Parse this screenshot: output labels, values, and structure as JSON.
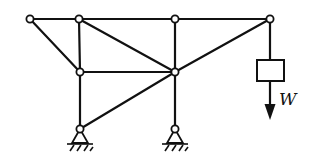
{
  "diagram": {
    "type": "truss-frame",
    "load_label": "W",
    "nodes": {
      "A": [
        30,
        19
      ],
      "B": [
        79,
        19
      ],
      "C": [
        175,
        19
      ],
      "D": [
        270,
        19
      ],
      "E": [
        80,
        72
      ],
      "F": [
        175,
        72
      ],
      "G": [
        80,
        129
      ],
      "H": [
        175,
        129
      ]
    },
    "members": [
      [
        "A",
        "B"
      ],
      [
        "B",
        "C"
      ],
      [
        "C",
        "D"
      ],
      [
        "A",
        "E"
      ],
      [
        "B",
        "E"
      ],
      [
        "B",
        "F"
      ],
      [
        "E",
        "F"
      ],
      [
        "D",
        "F"
      ],
      [
        "E",
        "G"
      ],
      [
        "G",
        "F"
      ],
      [
        "C",
        "F"
      ],
      [
        "F",
        "H"
      ]
    ],
    "supports": [
      "G",
      "H"
    ],
    "load": {
      "hang_from": "D",
      "box": [
        257,
        60,
        27,
        21
      ],
      "arrow_end_y": 118
    },
    "colors": {
      "line": "#111111",
      "background": "#ffffff"
    }
  }
}
